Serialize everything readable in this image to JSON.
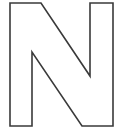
{
  "image": {
    "kind": "letterform-outline",
    "character": "N",
    "description": "Outlined uppercase letter N",
    "width": 120,
    "height": 134,
    "background_color": "#ffffff"
  },
  "glyph": {
    "name": "letter-n-outline",
    "character": "N",
    "case": "uppercase",
    "style": "outline",
    "fill": "none",
    "stroke_color": "#3a3a3a",
    "stroke_width": 1.6,
    "bounding_box": {
      "left": 10,
      "top": 3,
      "right": 113,
      "bottom": 126
    },
    "metrics": {
      "left_stem_outer_x": 10,
      "left_stem_inner_x": 32,
      "left_stem_width": 22,
      "right_stem_inner_x": 90,
      "right_stem_outer_x": 113,
      "right_stem_width": 23,
      "top_y": 3,
      "bottom_y": 126,
      "left_notch_corner_y": 45,
      "right_notch_corner_y": 88,
      "diagonal_top_x": 41,
      "diagonal_bottom_x": 82
    },
    "outline_path": "M 10 3 L 41 3 L 90 76 L 90 3 L 113 3 L 113 126 L 82 126 L 32 52 L 32 126 L 10 126 Z"
  }
}
